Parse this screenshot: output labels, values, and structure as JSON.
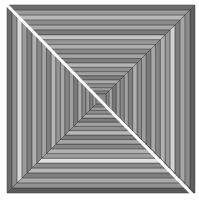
{
  "image": {
    "description": "Grayscale optical illusion: nested square tunnel of striped trapezoids with a white diagonal line from top-left to bottom-right",
    "background": "#ffffff",
    "square": {
      "x": 7,
      "y": 5,
      "size": 188
    },
    "center_square": {
      "size": 10,
      "fill": "#8a8a8a"
    },
    "stroke_color": "#3a3a3a",
    "diagonal": {
      "color": "#ffffff",
      "width": 3,
      "x1": 4,
      "y1": 2,
      "x2": 196,
      "y2": 198
    },
    "rings": {
      "count": 20,
      "top": [
        "#6e6e6e",
        "#9a9a9a",
        "#b8b8b8",
        "#8c8c8c",
        "#a8a8a8",
        "#7a7a7a",
        "#c4c4c4",
        "#969696",
        "#b0b0b0",
        "#888888",
        "#a4a4a4",
        "#7e7e7e",
        "#b4b4b4",
        "#909090",
        "#a0a0a0",
        "#7c7c7c",
        "#acacac",
        "#8e8e8e",
        "#9c9c9c",
        "#808080"
      ],
      "right": [
        "#5e5e5e",
        "#8c8c8c",
        "#a6a6a6",
        "#7c7c7c",
        "#d4d4d4",
        "#989898",
        "#b2b2b2",
        "#848484",
        "#a8a8a8",
        "#7a7a7a",
        "#9e9e9e",
        "#8a8a8a",
        "#b0b0b0",
        "#7e7e7e",
        "#a2a2a2",
        "#888888",
        "#9a9a9a",
        "#767676",
        "#a6a6a6",
        "#858585"
      ],
      "bottom": [
        "#5a5a5a",
        "#929292",
        "#aaaaaa",
        "#7e7e7e",
        "#b6b6b6",
        "#8a8a8a",
        "#e0e0e0",
        "#9c9c9c",
        "#b2b2b2",
        "#848484",
        "#a6a6a6",
        "#7c7c7c",
        "#b8b8b8",
        "#909090",
        "#a2a2a2",
        "#7a7a7a",
        "#aeaeae",
        "#8c8c8c",
        "#9e9e9e",
        "#828282"
      ],
      "left": [
        "#6a6a6a",
        "#8e8e8e",
        "#d8d8d8",
        "#9a9a9a",
        "#7c7c7c",
        "#b0b0b0",
        "#888888",
        "#a4a4a4",
        "#7e7e7e",
        "#b6b6b6",
        "#929292",
        "#a8a8a8",
        "#848484",
        "#a0a0a0",
        "#7a7a7a",
        "#aaaaaa",
        "#8a8a8a",
        "#9c9c9c",
        "#808080",
        "#a6a6a6"
      ]
    }
  }
}
